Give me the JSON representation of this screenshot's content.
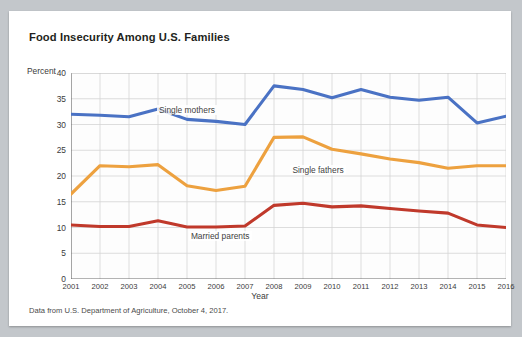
{
  "card": {
    "title": "Food Insecurity Among U.S. Families",
    "source_note": "Data from U.S. Department of Agriculture, October 4, 2017."
  },
  "chart_data": {
    "type": "line",
    "title": "Food Insecurity Among U.S. Families",
    "xlabel": "Year",
    "ylabel": "Percent",
    "ylim": [
      0,
      40
    ],
    "yticks": [
      0,
      5,
      10,
      15,
      20,
      25,
      30,
      35,
      40
    ],
    "grid": true,
    "legend_position": "inline-labels",
    "categories": [
      2001,
      2002,
      2003,
      2004,
      2005,
      2006,
      2007,
      2008,
      2009,
      2010,
      2011,
      2012,
      2013,
      2014,
      2015,
      2016
    ],
    "xtick_labels": [
      "2001",
      "2002",
      "2003",
      "2004",
      "2005",
      "2006",
      "2007",
      "2008",
      "2009",
      "2010",
      "2011",
      "2012",
      "2013",
      "2014",
      "2015",
      "2016"
    ],
    "series": [
      {
        "name": "Single mothers",
        "color": "#4a72c4",
        "values": [
          32.0,
          31.8,
          31.5,
          33.0,
          31.0,
          30.6,
          30.0,
          37.5,
          36.8,
          35.2,
          36.8,
          35.3,
          34.7,
          35.3,
          30.3,
          31.6
        ]
      },
      {
        "name": "Single fathers",
        "color": "#eda13f",
        "values": [
          16.5,
          22.0,
          21.8,
          22.2,
          18.1,
          17.2,
          18.0,
          27.5,
          27.6,
          25.2,
          24.3,
          23.3,
          22.6,
          21.5,
          22.0,
          22.0
        ]
      },
      {
        "name": "Married parents",
        "color": "#c0392b",
        "values": [
          10.5,
          10.2,
          10.2,
          11.3,
          10.1,
          10.1,
          10.3,
          14.3,
          14.7,
          14.0,
          14.2,
          13.7,
          13.2,
          12.8,
          10.5,
          10.0
        ]
      }
    ],
    "annotations": [
      {
        "text": "Single mothers",
        "x": 2005,
        "y": 32.6
      },
      {
        "text": "Single fathers",
        "x": 2009.6,
        "y": 21.0
      },
      {
        "text": "Married parents",
        "x": 2006.1,
        "y": 8.1
      }
    ]
  }
}
